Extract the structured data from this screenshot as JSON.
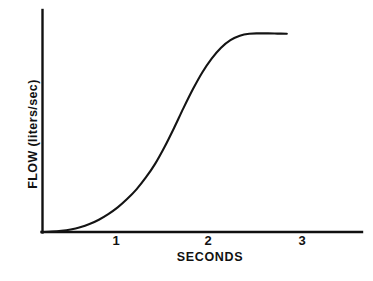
{
  "figure": {
    "background_color": "#ffffff",
    "ink_color": "#111111",
    "caption_remnant": "",
    "axis": {
      "y_axis_name": "y-axis",
      "x_axis_name": "x-axis"
    }
  },
  "chart_data": {
    "type": "line",
    "title": "",
    "subtitle": "",
    "xlabel": "SECONDS",
    "ylabel": "FLOW (liters/sec)",
    "xlim": [
      0,
      3.4
    ],
    "ylim": [
      0,
      1.12
    ],
    "xticks": [
      1,
      2,
      3
    ],
    "xtick_labels": [
      "1",
      "2",
      "3"
    ],
    "yticks": [],
    "ytick_labels": [],
    "grid": false,
    "legend": false,
    "legend_position": "none",
    "annotations": [],
    "series": [
      {
        "name": "flow",
        "x": [
          0.0,
          0.1,
          0.2,
          0.3,
          0.4,
          0.5,
          0.6,
          0.7,
          0.8,
          0.9,
          1.0,
          1.1,
          1.2,
          1.3,
          1.4,
          1.5,
          1.6,
          1.7,
          1.8,
          1.9,
          2.0,
          2.1,
          2.2,
          2.3,
          2.4,
          2.5,
          2.6
        ],
        "y": [
          0.0,
          0.002,
          0.006,
          0.013,
          0.024,
          0.04,
          0.062,
          0.09,
          0.124,
          0.166,
          0.215,
          0.275,
          0.345,
          0.43,
          0.525,
          0.625,
          0.72,
          0.805,
          0.875,
          0.93,
          0.968,
          0.99,
          1.0,
          1.002,
          1.002,
          1.001,
          1.0
        ]
      }
    ]
  },
  "ticks": {
    "x": [
      {
        "label": "1",
        "px": 116
      },
      {
        "label": "2",
        "px": 208
      },
      {
        "label": "3",
        "px": 302
      }
    ]
  }
}
